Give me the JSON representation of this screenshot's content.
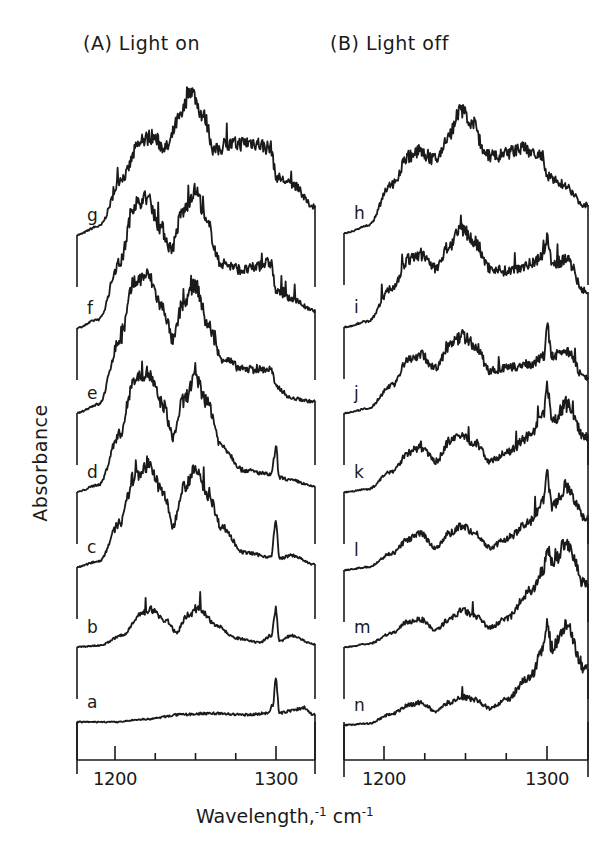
{
  "chart_data": {
    "type": "line",
    "title": "",
    "ylabel": "Absorbance",
    "xlabel": "Wavelength,⁻¹ cm⁻¹",
    "xlim": [
      1176,
      1325
    ],
    "x_ticks_major": [
      1200,
      1300
    ],
    "x_ticks_minor": [
      1225,
      1250,
      1275
    ],
    "panels": [
      {
        "title": "(A) Light on",
        "series": [
          {
            "name": "g",
            "x": [
              1176,
              1190,
              1205,
              1215,
              1222,
              1232,
              1240,
              1247,
              1255,
              1262,
              1270,
              1285,
              1297,
              1300,
              1310,
              1323
            ],
            "y": [
              0.0,
              0.06,
              0.4,
              0.62,
              0.68,
              0.6,
              0.8,
              1.0,
              0.82,
              0.58,
              0.62,
              0.64,
              0.6,
              0.4,
              0.35,
              0.2
            ]
          },
          {
            "name": "f",
            "x": [
              1176,
              1190,
              1203,
              1212,
              1220,
              1228,
              1235,
              1242,
              1250,
              1258,
              1265,
              1280,
              1297,
              1300,
              1310,
              1323
            ],
            "y": [
              0.0,
              0.06,
              0.45,
              0.85,
              0.9,
              0.7,
              0.55,
              0.8,
              0.95,
              0.7,
              0.45,
              0.4,
              0.45,
              0.25,
              0.2,
              0.12
            ]
          },
          {
            "name": "e",
            "x": [
              1176,
              1190,
              1203,
              1212,
              1220,
              1230,
              1236,
              1242,
              1250,
              1258,
              1266,
              1280,
              1297,
              1300,
              1310,
              1323
            ],
            "y": [
              0.0,
              0.06,
              0.5,
              0.9,
              0.95,
              0.72,
              0.5,
              0.75,
              0.88,
              0.6,
              0.38,
              0.3,
              0.3,
              0.18,
              0.1,
              0.08
            ]
          },
          {
            "name": "d",
            "x": [
              1176,
              1190,
              1203,
              1212,
              1220,
              1230,
              1236,
              1242,
              1250,
              1258,
              1266,
              1280,
              1297,
              1300,
              1302,
              1310,
              1323
            ],
            "y": [
              0.0,
              0.05,
              0.4,
              0.78,
              0.82,
              0.6,
              0.38,
              0.62,
              0.78,
              0.6,
              0.32,
              0.15,
              0.12,
              0.3,
              0.1,
              0.08,
              0.04
            ]
          },
          {
            "name": "c",
            "x": [
              1176,
              1190,
              1203,
              1212,
              1220,
              1230,
              1236,
              1242,
              1250,
              1258,
              1266,
              1280,
              1297,
              1300,
              1302,
              1310,
              1323
            ],
            "y": [
              0.0,
              0.04,
              0.3,
              0.62,
              0.7,
              0.52,
              0.28,
              0.55,
              0.66,
              0.5,
              0.28,
              0.1,
              0.07,
              0.32,
              0.06,
              0.08,
              0.02
            ]
          },
          {
            "name": "b",
            "x": [
              1176,
              1190,
              1205,
              1215,
              1222,
              1232,
              1238,
              1245,
              1252,
              1262,
              1275,
              1290,
              1297,
              1300,
              1302,
              1310,
              1323
            ],
            "y": [
              0.0,
              0.01,
              0.08,
              0.22,
              0.26,
              0.18,
              0.1,
              0.22,
              0.26,
              0.16,
              0.06,
              0.03,
              0.08,
              0.26,
              0.04,
              0.08,
              0.02
            ]
          },
          {
            "name": "a",
            "x": [
              1176,
              1200,
              1220,
              1240,
              1260,
              1280,
              1295,
              1298,
              1300,
              1302,
              1310,
              1318,
              1323
            ],
            "y": [
              0.0,
              0.0,
              0.02,
              0.05,
              0.06,
              0.05,
              0.06,
              0.12,
              0.3,
              0.06,
              0.08,
              0.1,
              0.05
            ]
          }
        ]
      },
      {
        "title": "(B) Light off",
        "series": [
          {
            "name": "h",
            "x": [
              1176,
              1190,
              1205,
              1215,
              1222,
              1232,
              1240,
              1247,
              1255,
              1262,
              1270,
              1285,
              1297,
              1300,
              1310,
              1323
            ],
            "y": [
              0.0,
              0.05,
              0.35,
              0.55,
              0.58,
              0.52,
              0.7,
              0.88,
              0.78,
              0.55,
              0.55,
              0.6,
              0.55,
              0.4,
              0.35,
              0.2
            ]
          },
          {
            "name": "i",
            "x": [
              1176,
              1190,
              1205,
              1215,
              1222,
              1232,
              1240,
              1248,
              1256,
              1265,
              1275,
              1290,
              1298,
              1300,
              1303,
              1312,
              1323
            ],
            "y": [
              0.0,
              0.04,
              0.28,
              0.48,
              0.52,
              0.42,
              0.58,
              0.7,
              0.6,
              0.42,
              0.4,
              0.45,
              0.52,
              0.65,
              0.45,
              0.48,
              0.25
            ]
          },
          {
            "name": "j",
            "x": [
              1176,
              1190,
              1205,
              1215,
              1222,
              1232,
              1240,
              1248,
              1256,
              1265,
              1275,
              1290,
              1298,
              1300,
              1303,
              1312,
              1323
            ],
            "y": [
              0.0,
              0.03,
              0.2,
              0.38,
              0.42,
              0.32,
              0.48,
              0.55,
              0.48,
              0.3,
              0.32,
              0.35,
              0.4,
              0.62,
              0.4,
              0.45,
              0.25
            ]
          },
          {
            "name": "k",
            "x": [
              1176,
              1190,
              1205,
              1215,
              1222,
              1232,
              1240,
              1248,
              1256,
              1265,
              1275,
              1290,
              1298,
              1300,
              1303,
              1312,
              1323
            ],
            "y": [
              0.0,
              0.02,
              0.15,
              0.28,
              0.32,
              0.22,
              0.36,
              0.4,
              0.35,
              0.22,
              0.28,
              0.4,
              0.55,
              0.75,
              0.5,
              0.62,
              0.4
            ]
          },
          {
            "name": "l",
            "x": [
              1176,
              1190,
              1205,
              1215,
              1222,
              1232,
              1240,
              1248,
              1256,
              1265,
              1275,
              1290,
              1298,
              1300,
              1303,
              1312,
              1323
            ],
            "y": [
              0.0,
              0.02,
              0.12,
              0.22,
              0.26,
              0.16,
              0.26,
              0.32,
              0.26,
              0.16,
              0.22,
              0.35,
              0.5,
              0.68,
              0.45,
              0.6,
              0.38
            ]
          },
          {
            "name": "m",
            "x": [
              1176,
              1190,
              1205,
              1215,
              1222,
              1232,
              1240,
              1248,
              1256,
              1265,
              1275,
              1290,
              1298,
              1300,
              1303,
              1312,
              1323
            ],
            "y": [
              0.0,
              0.02,
              0.1,
              0.18,
              0.2,
              0.12,
              0.2,
              0.26,
              0.22,
              0.14,
              0.2,
              0.4,
              0.55,
              0.72,
              0.58,
              0.75,
              0.45
            ]
          },
          {
            "name": "n",
            "x": [
              1176,
              1190,
              1205,
              1215,
              1222,
              1232,
              1240,
              1248,
              1256,
              1265,
              1275,
              1290,
              1298,
              1300,
              1303,
              1312,
              1323
            ],
            "y": [
              0.0,
              0.01,
              0.08,
              0.14,
              0.16,
              0.1,
              0.16,
              0.2,
              0.18,
              0.12,
              0.18,
              0.35,
              0.55,
              0.72,
              0.55,
              0.7,
              0.4
            ]
          }
        ]
      }
    ]
  },
  "labels": {
    "panel_a_title": "(A) Light on",
    "panel_b_title": "(B) Light off",
    "ylabel": "Absorbance",
    "xlabel_main": "Wavelength,",
    "xlabel_sup1": "-1",
    "xlabel_unit": " cm",
    "xlabel_sup2": "-1",
    "tick_1200": "1200",
    "tick_1300": "1300"
  }
}
